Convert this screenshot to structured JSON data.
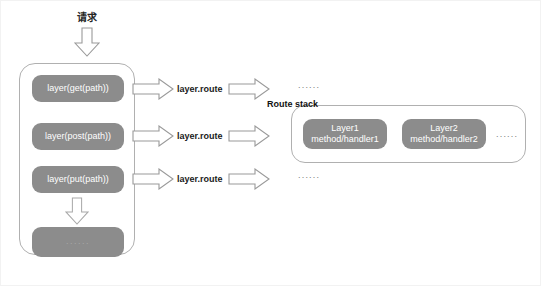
{
  "diagram": {
    "request_label": "请求",
    "router_box": {
      "name": "router",
      "layers": [
        {
          "label": "layer(get(path))"
        },
        {
          "label": "layer(post(path))"
        },
        {
          "label": "layer(put(path))"
        }
      ],
      "more_label": "......"
    },
    "route_arrows": [
      {
        "caption": "layer.route",
        "trailing": "......"
      },
      {
        "caption": "layer.route",
        "trailing": ""
      },
      {
        "caption": "layer.route",
        "trailing": "......"
      }
    ],
    "route_stack": {
      "title": "Route stack",
      "layers": [
        {
          "name": "Layer1",
          "handler": "method/handler1"
        },
        {
          "name": "Layer2",
          "handler": "method/handler2"
        }
      ],
      "more_label": "......"
    },
    "colors": {
      "pill_fill": "#8c8c8c",
      "pill_text": "#ffffff",
      "box_border": "#b0b0b0",
      "arrow_stroke": "#9a9a9a",
      "arrow_fill": "#ffffff",
      "canvas_bg": "#ffffff",
      "text": "#1a1a1a"
    }
  }
}
